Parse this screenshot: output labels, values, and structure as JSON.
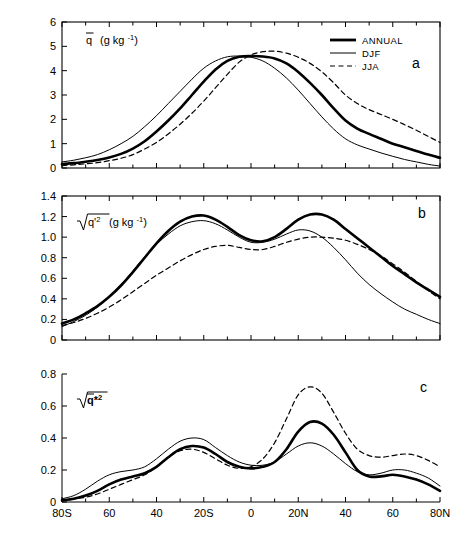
{
  "figure": {
    "background": "#ffffff",
    "line_color": "#000000"
  },
  "legend": {
    "position": "top-right of panel a",
    "entries": [
      {
        "label": "ANNUAL",
        "style": "thick-solid"
      },
      {
        "label": "DJF",
        "style": "thin-solid"
      },
      {
        "label": "JJA",
        "style": "dashed"
      }
    ]
  },
  "axis": {
    "x_tick_labels": [
      "80S",
      "60",
      "40",
      "20S",
      "0",
      "20N",
      "40",
      "60",
      "80N"
    ],
    "x_tick_values": [
      -80,
      -60,
      -40,
      -20,
      0,
      20,
      40,
      60,
      80
    ],
    "x_range": [
      -80,
      80
    ]
  },
  "panels": [
    {
      "letter": "a",
      "ylabel_main": "q",
      "ylabel_units": "(g kg",
      "ylabel_exp": "-1",
      "ylabel_close": ")",
      "y_tick_labels": [
        "0",
        "1",
        "2",
        "3",
        "4",
        "5",
        "6"
      ],
      "y_range": [
        0,
        6
      ]
    },
    {
      "letter": "b",
      "ylabel_main": "q'",
      "ylabel_sq": "2",
      "ylabel_units": "(g kg",
      "ylabel_exp": "-1",
      "ylabel_close": ")",
      "y_tick_labels": [
        "0",
        "0.2",
        "0.4",
        "0.6",
        "0.8",
        "1.0",
        "1.2",
        "1.4"
      ],
      "y_range": [
        0,
        1.4
      ]
    },
    {
      "letter": "c",
      "ylabel_main": "q*",
      "ylabel_sq": "2",
      "y_tick_labels": [
        "0",
        "0.2",
        "0.4",
        "0.6",
        "0.8"
      ],
      "y_range": [
        0,
        0.8
      ]
    }
  ],
  "chart_data": [
    {
      "type": "line",
      "panel": "a",
      "title": "q̄ (g kg⁻¹)",
      "xlabel": "Latitude",
      "ylabel": "q̄ (g kg⁻¹)",
      "xlim": [
        -80,
        80
      ],
      "ylim": [
        0,
        6
      ],
      "yticks": [
        0,
        1,
        2,
        3,
        4,
        5,
        6
      ],
      "xticks": [
        -80,
        -60,
        -40,
        -20,
        0,
        20,
        40,
        60,
        80
      ],
      "xticklabels": [
        "80S",
        "60",
        "40",
        "20S",
        "0",
        "20N",
        "40",
        "60",
        "80N"
      ],
      "grid": false,
      "legend": [
        "ANNUAL",
        "DJF",
        "JJA"
      ],
      "x": [
        -80,
        -75,
        -70,
        -65,
        -60,
        -55,
        -50,
        -45,
        -40,
        -35,
        -30,
        -25,
        -20,
        -15,
        -10,
        -5,
        0,
        5,
        10,
        15,
        20,
        25,
        30,
        35,
        40,
        45,
        50,
        55,
        60,
        65,
        70,
        75,
        80
      ],
      "series": [
        {
          "name": "ANNUAL",
          "style": "thick-solid",
          "values": [
            0.16,
            0.2,
            0.26,
            0.33,
            0.43,
            0.58,
            0.8,
            1.1,
            1.5,
            1.95,
            2.45,
            3.0,
            3.55,
            4.05,
            4.4,
            4.57,
            4.6,
            4.58,
            4.5,
            4.3,
            3.95,
            3.5,
            3.0,
            2.45,
            1.95,
            1.62,
            1.4,
            1.2,
            1.0,
            0.85,
            0.7,
            0.55,
            0.42
          ]
        },
        {
          "name": "DJF",
          "style": "thin-solid",
          "values": [
            0.25,
            0.32,
            0.42,
            0.55,
            0.75,
            1.0,
            1.3,
            1.7,
            2.15,
            2.65,
            3.15,
            3.65,
            4.1,
            4.4,
            4.57,
            4.6,
            4.55,
            4.4,
            4.1,
            3.7,
            3.2,
            2.65,
            2.1,
            1.6,
            1.2,
            0.95,
            0.78,
            0.62,
            0.48,
            0.35,
            0.25,
            0.15,
            0.08
          ]
        },
        {
          "name": "JJA",
          "style": "dashed",
          "values": [
            0.1,
            0.13,
            0.17,
            0.22,
            0.3,
            0.4,
            0.55,
            0.78,
            1.05,
            1.4,
            1.8,
            2.25,
            2.75,
            3.3,
            3.85,
            4.35,
            4.65,
            4.78,
            4.8,
            4.72,
            4.55,
            4.3,
            3.95,
            3.5,
            3.0,
            2.65,
            2.4,
            2.2,
            2.0,
            1.78,
            1.55,
            1.3,
            1.05
          ]
        }
      ]
    },
    {
      "type": "line",
      "panel": "b",
      "title": "√(q'²) (g kg⁻¹)",
      "xlabel": "Latitude",
      "ylabel": "√(q'²) (g kg⁻¹)",
      "xlim": [
        -80,
        80
      ],
      "ylim": [
        0,
        1.4
      ],
      "yticks": [
        0,
        0.2,
        0.4,
        0.6,
        0.8,
        1.0,
        1.2,
        1.4
      ],
      "xticks": [
        -80,
        -60,
        -40,
        -20,
        0,
        20,
        40,
        60,
        80
      ],
      "xticklabels": [
        "80S",
        "60",
        "40",
        "20S",
        "0",
        "20N",
        "40",
        "60",
        "80N"
      ],
      "grid": false,
      "legend": [
        "ANNUAL",
        "DJF",
        "JJA"
      ],
      "x": [
        -80,
        -75,
        -70,
        -65,
        -60,
        -55,
        -50,
        -45,
        -40,
        -35,
        -30,
        -25,
        -20,
        -15,
        -10,
        -5,
        0,
        5,
        10,
        15,
        20,
        25,
        30,
        35,
        40,
        45,
        50,
        55,
        60,
        65,
        70,
        75,
        80
      ],
      "series": [
        {
          "name": "ANNUAL",
          "style": "thick-solid",
          "values": [
            0.16,
            0.2,
            0.26,
            0.33,
            0.42,
            0.53,
            0.66,
            0.8,
            0.94,
            1.06,
            1.15,
            1.2,
            1.21,
            1.17,
            1.1,
            1.02,
            0.97,
            0.96,
            1.0,
            1.08,
            1.17,
            1.22,
            1.22,
            1.17,
            1.08,
            0.99,
            0.9,
            0.81,
            0.72,
            0.64,
            0.56,
            0.49,
            0.42
          ]
        },
        {
          "name": "DJF",
          "style": "thin-solid",
          "values": [
            0.13,
            0.18,
            0.24,
            0.32,
            0.42,
            0.54,
            0.67,
            0.81,
            0.93,
            1.03,
            1.11,
            1.15,
            1.16,
            1.13,
            1.07,
            1.0,
            0.95,
            0.95,
            0.98,
            1.03,
            1.07,
            1.06,
            1.0,
            0.9,
            0.78,
            0.65,
            0.54,
            0.45,
            0.37,
            0.3,
            0.25,
            0.2,
            0.16
          ]
        },
        {
          "name": "JJA",
          "style": "dashed",
          "values": [
            0.14,
            0.17,
            0.21,
            0.26,
            0.32,
            0.39,
            0.47,
            0.55,
            0.63,
            0.7,
            0.77,
            0.83,
            0.88,
            0.91,
            0.92,
            0.9,
            0.88,
            0.88,
            0.91,
            0.95,
            0.98,
            1.0,
            1.0,
            0.99,
            0.97,
            0.93,
            0.88,
            0.82,
            0.74,
            0.66,
            0.57,
            0.48,
            0.4
          ]
        }
      ]
    },
    {
      "type": "line",
      "panel": "c",
      "title": "√(q̄*²)",
      "xlabel": "Latitude",
      "ylabel": "√(q̄*²)",
      "xlim": [
        -80,
        80
      ],
      "ylim": [
        0,
        0.8
      ],
      "yticks": [
        0,
        0.2,
        0.4,
        0.6,
        0.8
      ],
      "xticks": [
        -80,
        -60,
        -40,
        -20,
        0,
        20,
        40,
        60,
        80
      ],
      "xticklabels": [
        "80S",
        "60",
        "40",
        "20S",
        "0",
        "20N",
        "40",
        "60",
        "80N"
      ],
      "grid": false,
      "legend": [
        "ANNUAL",
        "DJF",
        "JJA"
      ],
      "x": [
        -80,
        -75,
        -70,
        -65,
        -60,
        -55,
        -50,
        -45,
        -40,
        -35,
        -30,
        -25,
        -20,
        -15,
        -10,
        -5,
        0,
        5,
        10,
        15,
        20,
        25,
        30,
        35,
        40,
        45,
        50,
        55,
        60,
        65,
        70,
        75,
        80
      ],
      "series": [
        {
          "name": "ANNUAL",
          "style": "thick-solid",
          "values": [
            0.01,
            0.02,
            0.04,
            0.07,
            0.11,
            0.14,
            0.16,
            0.18,
            0.22,
            0.28,
            0.33,
            0.35,
            0.34,
            0.3,
            0.25,
            0.22,
            0.21,
            0.22,
            0.25,
            0.33,
            0.44,
            0.5,
            0.49,
            0.42,
            0.31,
            0.2,
            0.16,
            0.16,
            0.17,
            0.16,
            0.14,
            0.11,
            0.07
          ]
        },
        {
          "name": "DJF",
          "style": "thin-solid",
          "values": [
            0.02,
            0.04,
            0.08,
            0.13,
            0.17,
            0.19,
            0.2,
            0.22,
            0.27,
            0.33,
            0.38,
            0.4,
            0.39,
            0.34,
            0.29,
            0.25,
            0.23,
            0.23,
            0.25,
            0.3,
            0.35,
            0.37,
            0.35,
            0.3,
            0.24,
            0.19,
            0.17,
            0.18,
            0.2,
            0.2,
            0.18,
            0.15,
            0.1
          ]
        },
        {
          "name": "JJA",
          "style": "dashed",
          "values": [
            0.01,
            0.02,
            0.03,
            0.05,
            0.08,
            0.11,
            0.14,
            0.17,
            0.22,
            0.28,
            0.32,
            0.33,
            0.31,
            0.27,
            0.23,
            0.21,
            0.22,
            0.27,
            0.37,
            0.52,
            0.67,
            0.72,
            0.68,
            0.56,
            0.43,
            0.33,
            0.29,
            0.28,
            0.29,
            0.3,
            0.29,
            0.26,
            0.22
          ]
        }
      ]
    }
  ]
}
